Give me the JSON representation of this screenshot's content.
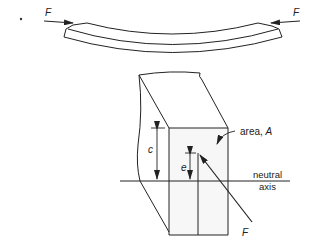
{
  "figure": {
    "labels": {
      "force_left": "F",
      "force_right": "F",
      "force_bottom": "F",
      "c": "c",
      "e": "e",
      "area_prefix": "area, ",
      "area_symbol": "A",
      "neutral_line1": "neutral",
      "neutral_line2": "axis"
    }
  }
}
